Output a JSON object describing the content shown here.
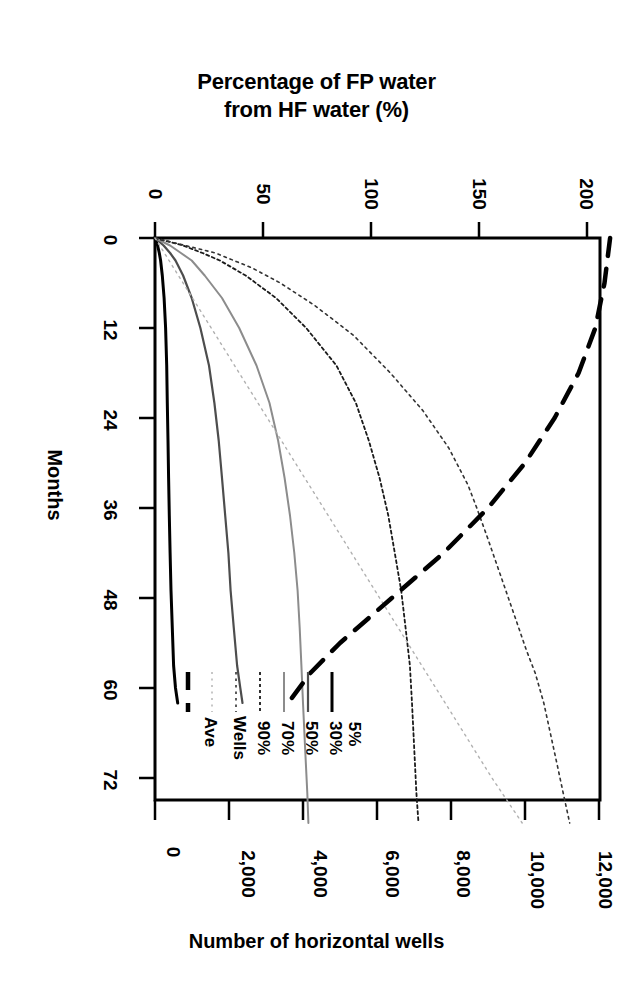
{
  "chart_data": {
    "type": "line",
    "title": "Percentage of FP water from HF water (%)",
    "title_line1": "Percentage of FP water",
    "title_line2": "from HF water (%)",
    "xlabel": "Percentage of FP water from HF water (%)",
    "ylabel": "Months",
    "secondary_xlabel": "Number of horizontal wells",
    "orientation": "rotated-90-clockwise",
    "axes": {
      "top": {
        "label": "Percentage of FP water from HF water (%)",
        "ticks": [
          0,
          50,
          100,
          150,
          200
        ],
        "tick_labels": [
          "0",
          "50",
          "100",
          "150",
          "200"
        ],
        "range": [
          0,
          205
        ]
      },
      "left": {
        "label": "Months",
        "ticks": [
          0,
          12,
          24,
          36,
          48,
          60,
          72
        ],
        "tick_labels": [
          "0",
          "12",
          "24",
          "36",
          "48",
          "60",
          "72"
        ],
        "range": [
          0,
          78
        ]
      },
      "bottom": {
        "label": "Number of horizontal wells",
        "ticks": [
          0,
          2000,
          4000,
          6000,
          8000,
          10000,
          12000
        ],
        "tick_labels": [
          "0",
          "2,000",
          "4,000",
          "6,000",
          "8,000",
          "10,000",
          "12,000"
        ],
        "range": [
          0,
          12600
        ]
      },
      "grid": false
    },
    "legend": {
      "position": "bottom-left-inside",
      "entries": [
        {
          "label": "5%",
          "style": "solid",
          "color": "#000000",
          "width": 3.0
        },
        {
          "label": "30%",
          "style": "solid",
          "color": "#4d4d4d",
          "width": 2.2
        },
        {
          "label": "50%",
          "style": "solid",
          "color": "#8c8c8c",
          "width": 2.0
        },
        {
          "label": "70%",
          "style": "dotted-dense",
          "color": "#1a1a1a",
          "width": 1.8
        },
        {
          "label": "90%",
          "style": "dotted",
          "color": "#333333",
          "width": 1.6
        },
        {
          "label": "Wells",
          "style": "dotted-light",
          "color": "#b0b0b0",
          "width": 1.4
        },
        {
          "label": "Ave",
          "style": "dashed-thick",
          "color": "#000000",
          "width": 4.5
        }
      ]
    },
    "series": [
      {
        "name": "5%",
        "axis": "percentage",
        "x_months": [
          0,
          1,
          2,
          3,
          5,
          8,
          12,
          17,
          22,
          27,
          32,
          37,
          42,
          47,
          52,
          57,
          60,
          62
        ],
        "y_percent": [
          0,
          1.2,
          2.0,
          2.6,
          3.4,
          4.2,
          4.9,
          5.4,
          5.7,
          6.0,
          6.3,
          6.6,
          7.0,
          7.4,
          8.0,
          8.6,
          9.5,
          10.5
        ]
      },
      {
        "name": "30%",
        "axis": "percentage",
        "x_months": [
          0,
          1,
          2,
          3,
          5,
          8,
          12,
          17,
          22,
          27,
          32,
          37,
          42,
          47,
          52,
          57,
          60,
          62
        ],
        "y_percent": [
          0,
          4,
          7,
          9.5,
          13,
          17,
          21,
          25,
          27.5,
          29.5,
          31,
          32.5,
          34,
          35,
          36.5,
          38,
          39.5,
          40.5
        ]
      },
      {
        "name": "50%",
        "axis": "percentage",
        "x_months": [
          0,
          1,
          2,
          3,
          5,
          8,
          12,
          17,
          22,
          27,
          32,
          37,
          42,
          47,
          52,
          57,
          62,
          68,
          74,
          78
        ],
        "y_percent": [
          0,
          7,
          12,
          17,
          23,
          31,
          39,
          47,
          53,
          57,
          60,
          62.5,
          64.5,
          66,
          67,
          67.8,
          68.5,
          69.5,
          70.5,
          71
        ]
      },
      {
        "name": "70%",
        "axis": "percentage",
        "x_months": [
          0,
          1,
          2,
          3,
          5,
          8,
          12,
          17,
          22,
          27,
          32,
          37,
          42,
          47,
          52,
          57,
          62,
          68,
          74,
          78
        ],
        "y_percent": [
          0,
          13,
          22,
          30,
          42,
          56,
          70,
          84,
          93,
          99,
          104,
          108,
          111,
          114,
          116,
          118,
          119,
          120,
          121,
          122
        ]
      },
      {
        "name": "90%",
        "axis": "percentage",
        "x_months": [
          0,
          2,
          4,
          6,
          9,
          13,
          18,
          23,
          28,
          33,
          36,
          40,
          45,
          50,
          55,
          58,
          62,
          66,
          70,
          74,
          78
        ],
        "y_percent": [
          0,
          28,
          45,
          58,
          74,
          92,
          109,
          124,
          136,
          145,
          149,
          154,
          160,
          166,
          172,
          176,
          180,
          183,
          186,
          189,
          192
        ]
      },
      {
        "name": "Wells",
        "axis": "percentage",
        "description": "near-linear light dotted reference line",
        "x_months": [
          0,
          12,
          24,
          36,
          48,
          60,
          72,
          78
        ],
        "y_percent": [
          0,
          26,
          52,
          78,
          104,
          130,
          156,
          170
        ]
      },
      {
        "name": "Ave",
        "axis": "wells",
        "description": "thick dashed curve read against the bottom 'Number of horizontal wells' axis",
        "x_months": [
          0,
          6,
          12,
          18,
          24,
          30,
          36,
          42,
          48,
          54,
          58,
          62
        ],
        "y_wells": [
          12300,
          12150,
          11900,
          11450,
          10800,
          10000,
          9000,
          7800,
          6400,
          5000,
          4200,
          3600
        ]
      }
    ]
  },
  "labels": {
    "title_line1": "Percentage of FP water",
    "title_line2": "from HF water (%)",
    "months": "Months",
    "bottom": "Number of horizontal wells"
  }
}
